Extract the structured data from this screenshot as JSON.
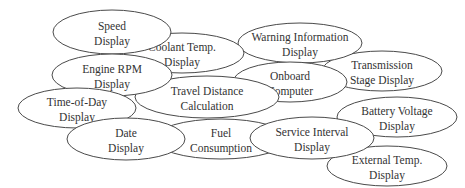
{
  "diagram": {
    "type": "feature-bubble-cluster",
    "colors": {
      "stroke": "#4a4a4a",
      "fill": "#ffffff",
      "text": "#333333"
    },
    "nodes": [
      {
        "id": "speed",
        "lines": [
          "Speed",
          "Display"
        ],
        "cx": 112,
        "cy": 32,
        "rx": 59,
        "ry": 22
      },
      {
        "id": "coolant",
        "lines": [
          "Coolant Temp.",
          "Display"
        ],
        "cx": 182,
        "cy": 53,
        "rx": 62,
        "ry": 20
      },
      {
        "id": "warning",
        "lines": [
          "Warning Information",
          "Display"
        ],
        "cx": 300,
        "cy": 43,
        "rx": 62,
        "ry": 20
      },
      {
        "id": "rpm",
        "lines": [
          "Engine RPM",
          "Display"
        ],
        "cx": 112,
        "cy": 75,
        "rx": 60,
        "ry": 21
      },
      {
        "id": "onboard",
        "lines": [
          "Onboard",
          "Computer"
        ],
        "cx": 290,
        "cy": 82,
        "rx": 57,
        "ry": 20
      },
      {
        "id": "transmission",
        "lines": [
          "Transmission",
          "Stage Display"
        ],
        "cx": 382,
        "cy": 71,
        "rx": 60,
        "ry": 20
      },
      {
        "id": "travel",
        "lines": [
          "Travel Distance",
          "Calculation"
        ],
        "cx": 207,
        "cy": 97,
        "rx": 72,
        "ry": 21
      },
      {
        "id": "timeofday",
        "lines": [
          "Time-of-Day",
          "Display"
        ],
        "cx": 77,
        "cy": 108,
        "rx": 59,
        "ry": 20
      },
      {
        "id": "battery",
        "lines": [
          "Battery Voltage",
          "Display"
        ],
        "cx": 397,
        "cy": 117,
        "rx": 60,
        "ry": 20
      },
      {
        "id": "date",
        "lines": [
          "Date",
          "Display"
        ],
        "cx": 126,
        "cy": 139,
        "rx": 59,
        "ry": 21
      },
      {
        "id": "fuel",
        "lines": [
          "Fuel",
          "Consumption"
        ],
        "cx": 221,
        "cy": 139,
        "rx": 67,
        "ry": 20
      },
      {
        "id": "service",
        "lines": [
          "Service Interval",
          "Display"
        ],
        "cx": 312,
        "cy": 138,
        "rx": 62,
        "ry": 21
      },
      {
        "id": "external",
        "lines": [
          "External Temp.",
          "Display"
        ],
        "cx": 387,
        "cy": 166,
        "rx": 60,
        "ry": 20
      }
    ]
  }
}
